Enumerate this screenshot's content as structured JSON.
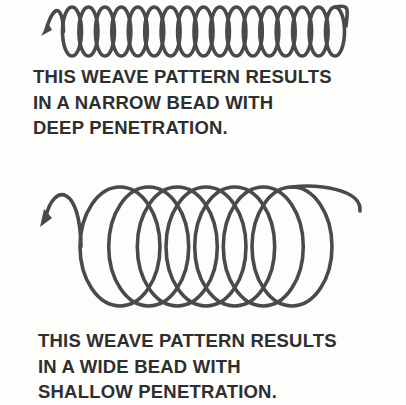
{
  "figure": {
    "stroke_color": "#4a4a4a",
    "text_color": "#2f2f2f",
    "top": {
      "name": "narrow-weave",
      "loop_count": 17,
      "caption": [
        "THIS WEAVE PATTERN RESULTS",
        "IN A NARROW BEAD WITH",
        "DEEP PENETRATION."
      ]
    },
    "bottom": {
      "name": "wide-weave",
      "loop_count": 7,
      "caption": [
        "THIS WEAVE PATTERN RESULTS",
        "IN A WIDE BEAD WITH",
        "SHALLOW PENETRATION."
      ]
    }
  }
}
